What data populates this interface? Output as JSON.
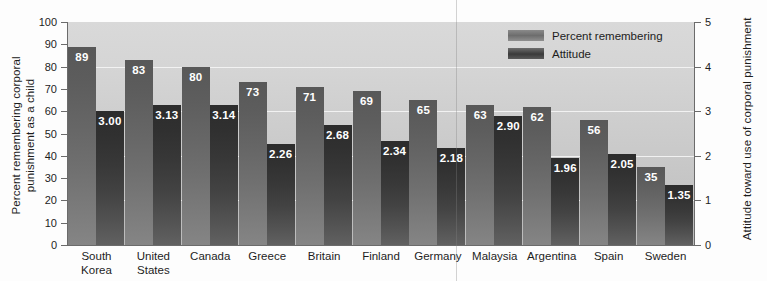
{
  "chart_data": {
    "type": "bar",
    "title": "",
    "categories": [
      "South Korea",
      "United States",
      "Canada",
      "Greece",
      "Britain",
      "Finland",
      "Germany",
      "Malaysia",
      "Argentina",
      "Spain",
      "Sweden"
    ],
    "series": [
      {
        "name": "Percent remembering",
        "axis": "left",
        "values": [
          89,
          83,
          80,
          73,
          71,
          69,
          65,
          63,
          62,
          56,
          35
        ],
        "labels": [
          "89",
          "83",
          "80",
          "73",
          "71",
          "69",
          "65",
          "63",
          "62",
          "56",
          "35"
        ]
      },
      {
        "name": "Attitude",
        "axis": "right",
        "values": [
          3.0,
          3.13,
          3.14,
          2.26,
          2.68,
          2.34,
          2.18,
          2.9,
          1.96,
          2.05,
          1.35
        ],
        "labels": [
          "3.00",
          "3.13",
          "3.14",
          "2.26",
          "2.68",
          "2.34",
          "2.18",
          "2.90",
          "1.96",
          "2.05",
          "1.35"
        ]
      }
    ],
    "xlabel": "",
    "ylabel": "Percent remembering corporal\npunishment as a child",
    "ylabel_right": "Attitude toward use of corporal punishment",
    "ylim": [
      0,
      100
    ],
    "ylim_right": [
      0,
      5
    ],
    "yticks": [
      0,
      10,
      20,
      30,
      40,
      50,
      60,
      70,
      80,
      90,
      100
    ],
    "yticks_right": [
      0,
      1,
      2,
      3,
      4,
      5
    ],
    "grid": true,
    "legend_position": "top-right",
    "colors": {
      "percent_remembering": "#6b6b6b",
      "attitude": "#3a3a3a",
      "plot_background": "#cdcdcd",
      "gridline": "#f2f2f2",
      "axis": "#6b6b6b",
      "text": "#1d1d1d",
      "value_label": "#ffffff"
    }
  },
  "axes": {
    "left": {
      "title": "Percent remembering corporal\npunishment as a child",
      "tick_labels": [
        "100",
        "90",
        "80",
        "70",
        "60",
        "50",
        "40",
        "30",
        "20",
        "10",
        "0"
      ]
    },
    "right": {
      "title": "Attitude toward use of corporal punishment",
      "tick_labels": [
        "5",
        "4",
        "3",
        "2",
        "1",
        "0"
      ]
    }
  },
  "legend": {
    "items": [
      {
        "label": "Percent remembering",
        "swatch": "sw-percent"
      },
      {
        "label": "Attitude",
        "swatch": "sw-attitude"
      }
    ]
  },
  "category_labels": [
    "South\nKorea",
    "United\nStates",
    "Canada",
    "Greece",
    "Britain",
    "Finland",
    "Germany",
    "Malaysia",
    "Argentina",
    "Spain",
    "Sweden"
  ]
}
